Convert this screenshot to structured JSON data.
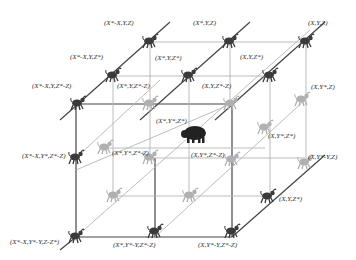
{
  "diagram": {
    "center_figure": {
      "label": "(X*,Y*,Z*)",
      "icon": "bison-icon",
      "color": "#222222"
    },
    "nodes": [
      {
        "id": "n1",
        "label": "(X*-X,Y,Z)",
        "x": 150,
        "y": 42,
        "lx": 104,
        "ly": 19,
        "shade": "dark"
      },
      {
        "id": "n2",
        "label": "(X*,Y,Z)",
        "x": 230,
        "y": 42,
        "lx": 193,
        "ly": 19,
        "shade": "dark"
      },
      {
        "id": "n3",
        "label": "(X,Y,Z)",
        "x": 306,
        "y": 42,
        "lx": 308,
        "ly": 19,
        "shade": "dark"
      },
      {
        "id": "n4",
        "label": "(X*-X,Y,Z*)",
        "x": 113,
        "y": 76,
        "lx": 70,
        "ly": 53,
        "shade": "dark"
      },
      {
        "id": "n5",
        "label": "(X*,Y,Z*)",
        "x": 189,
        "y": 76,
        "lx": 155,
        "ly": 54,
        "shade": "dark"
      },
      {
        "id": "n6",
        "label": "(X,Y,Z*)",
        "x": 270,
        "y": 76,
        "lx": 240,
        "ly": 53,
        "shade": "dark"
      },
      {
        "id": "n7",
        "label": "(X*-X,Y,Z*-Z)",
        "x": 78,
        "y": 104,
        "lx": 32,
        "ly": 82,
        "shade": "dark"
      },
      {
        "id": "n8",
        "label": "(X*,Y,Z*-Z)",
        "x": 150,
        "y": 104,
        "lx": 117,
        "ly": 82,
        "shade": "light"
      },
      {
        "id": "n9",
        "label": "(X,Y,Z*-Z)",
        "x": 231,
        "y": 104,
        "lx": 202,
        "ly": 82,
        "shade": "light"
      },
      {
        "id": "n10",
        "label": "(X,Y*,Z)",
        "x": 302,
        "y": 100,
        "lx": 311,
        "ly": 83,
        "shade": "light"
      },
      {
        "id": "n11",
        "label": "(X*,Y*,Z*-Z)",
        "x": 105,
        "y": 148,
        "lx": 0,
        "ly": 0,
        "shade": "light"
      },
      {
        "id": "n12",
        "label": "(X,Y*,Z*)",
        "x": 265,
        "y": 128,
        "lx": 268,
        "ly": 132,
        "shade": "light"
      },
      {
        "id": "n13",
        "label": "(X*-X,Y*,Z*-Z)",
        "x": 76,
        "y": 158,
        "lx": 22,
        "ly": 152,
        "shade": "dark"
      },
      {
        "id": "n14",
        "label": "(X*,Y*,Z*-Z)",
        "x": 150,
        "y": 158,
        "lx": 112,
        "ly": 149,
        "shade": "light"
      },
      {
        "id": "n15",
        "label": "(X,Y*,Z*-Z)",
        "x": 232,
        "y": 160,
        "lx": 191,
        "ly": 151,
        "shade": "light"
      },
      {
        "id": "n16",
        "label": "(X,Y*-Y,Z)",
        "x": 305,
        "y": 163,
        "lx": 308,
        "ly": 153,
        "shade": "light"
      },
      {
        "id": "n17",
        "label": "(X*-X,Y*-Y,Z)",
        "x": 114,
        "y": 196,
        "lx": 0,
        "ly": 0,
        "shade": "light"
      },
      {
        "id": "n18",
        "label": "(X*,Y*-Y,Z)",
        "x": 190,
        "y": 196,
        "lx": 0,
        "ly": 0,
        "shade": "light"
      },
      {
        "id": "n19",
        "label": "(X,Y,Z*)",
        "x": 268,
        "y": 197,
        "lx": 279,
        "ly": 195,
        "shade": "dark"
      },
      {
        "id": "n20",
        "label": "(X*-X,Y*-Y,Z-Z*)",
        "x": 76,
        "y": 237,
        "lx": 10,
        "ly": 238,
        "shade": "dark"
      },
      {
        "id": "n21",
        "label": "(X*,Y*-Y,Z*-Z)",
        "x": 155,
        "y": 232,
        "lx": 113,
        "ly": 241,
        "shade": "dark"
      },
      {
        "id": "n22",
        "label": "(X,Y*-Y,Z*-Z)",
        "x": 232,
        "y": 232,
        "lx": 198,
        "ly": 241,
        "shade": "dark"
      }
    ],
    "center": {
      "x": 194,
      "y": 133,
      "lx": 156,
      "ly": 117
    },
    "colors": {
      "dark_line": "#444444",
      "light_line": "#aaaaaa",
      "dark_figure": "#3a3a3a",
      "light_figure": "#b0b0b0",
      "label": "#333333"
    }
  }
}
